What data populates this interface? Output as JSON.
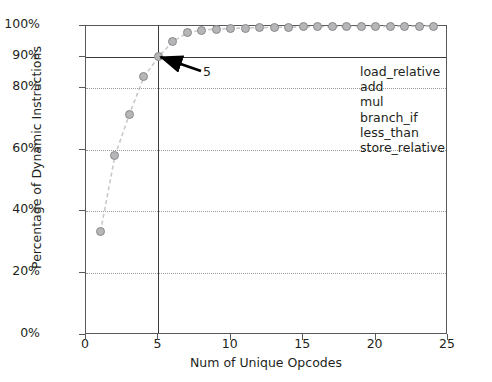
{
  "chart_data": {
    "type": "line",
    "title": "",
    "xlabel": "Num of Unique Opcodes",
    "ylabel": "Percentage of Dynamic Instructions",
    "xlim": [
      0,
      25
    ],
    "ylim": [
      0,
      100
    ],
    "grid": true,
    "legend": "none",
    "xticks": [
      0,
      5,
      10,
      15,
      20,
      25
    ],
    "xtick_labels": [
      "0",
      "5",
      "10",
      "15",
      "20",
      "25"
    ],
    "yticks": [
      0,
      20,
      40,
      60,
      80,
      90,
      100
    ],
    "ytick_labels": [
      "0%",
      "20%",
      "40%",
      "60%",
      "80%",
      "90%",
      "100%"
    ],
    "gridline_values": [
      20,
      40,
      60,
      80
    ],
    "series": [
      {
        "name": "cumulative dynamic instruction coverage",
        "marker": "circle",
        "linestyle": "dashed",
        "marker_color": "#b6b6b8",
        "line_color": "#c9c9cb",
        "x": [
          1,
          2,
          3,
          4,
          5,
          6,
          7,
          8,
          9,
          10,
          11,
          12,
          13,
          14,
          15,
          16,
          17,
          18,
          19,
          20,
          21,
          22,
          23,
          24
        ],
        "values": [
          33.5,
          58.0,
          71.5,
          83.5,
          90.0,
          95.0,
          97.8,
          98.7,
          99.0,
          99.2,
          99.35,
          99.45,
          99.55,
          99.62,
          99.68,
          99.73,
          99.78,
          99.82,
          99.85,
          99.88,
          99.9,
          99.92,
          99.94,
          99.96
        ]
      }
    ],
    "reference_lines": [
      {
        "orientation": "vertical",
        "value": 5,
        "color": "#3a3a3c"
      },
      {
        "orientation": "horizontal",
        "value": 90,
        "color": "#3a3a3c"
      }
    ],
    "annotations": [
      {
        "text": "5",
        "points_to_x": 5,
        "points_to_y": 90,
        "arrow": true
      }
    ]
  },
  "opcodes": {
    "items": [
      "load_relative",
      "add",
      "mul",
      "branch_if",
      "less_than",
      "store_relative"
    ]
  },
  "colors": {
    "axis": "#59595b",
    "reference_line": "#3a3a3c",
    "gridline": "#9b9b9b",
    "marker_fill": "#b6b6b8",
    "marker_edge": "#8a8a8c",
    "trend_line": "#c9c9cb",
    "text": "#231f20",
    "background": "#ffffff"
  }
}
